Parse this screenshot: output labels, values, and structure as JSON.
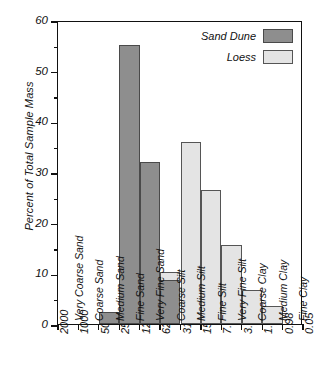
{
  "chart_data": {
    "type": "bar",
    "title": "",
    "xlabel": "",
    "ylabel": "Percent of Total Sample Mass",
    "ylim": [
      0,
      60
    ],
    "ytick_values": [
      0,
      10,
      20,
      30,
      40,
      50,
      60
    ],
    "ytick_labels": [
      "0",
      "10",
      "20",
      "30",
      "40",
      "50",
      "60"
    ],
    "yminor_step": 5,
    "grid": false,
    "legend_position": "top-right",
    "xtick_labels": [
      "2000",
      "1000",
      "500",
      "250",
      "125",
      "62.5",
      "31.3",
      "15.6",
      "7.8",
      "3.9",
      "1.95",
      "0.98",
      "0.05"
    ],
    "categories": [
      "Very Coarse Sand",
      "Coarse Sand",
      "Medium Sand",
      "Fine Sand",
      "Very Fine Sand",
      "Coarse Silt",
      "Medium Silt",
      "Fine Silt",
      "Very Fine Silt",
      "Coarse Clay",
      "Medium Clay",
      "Fine Clay"
    ],
    "series": [
      {
        "name": "Sand Dune",
        "color": "#8e8e8e",
        "values": [
          0,
          0,
          2.4,
          55,
          32,
          8.7,
          0,
          0,
          0,
          0,
          0,
          0
        ]
      },
      {
        "name": "Loess",
        "color": "#e4e4e4",
        "values": [
          0,
          0,
          0,
          0,
          0,
          10.2,
          36,
          26.4,
          15.6,
          6.8,
          3.5,
          0
        ]
      }
    ]
  },
  "legend": {
    "items": [
      {
        "label": "Sand Dune",
        "swatch": "dune"
      },
      {
        "label": "Loess",
        "swatch": "loess"
      }
    ]
  }
}
